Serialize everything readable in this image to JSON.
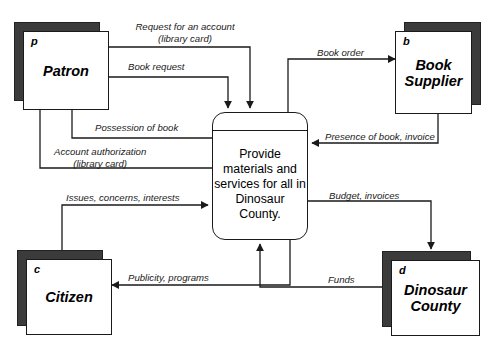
{
  "diagram": {
    "type": "data-flow-diagram"
  },
  "process": {
    "id": "",
    "label": "Provide materials and services for all in Dinosaur County."
  },
  "entities": [
    {
      "key": "patron",
      "id": "p",
      "name": "Patron"
    },
    {
      "key": "book_supplier",
      "id": "b",
      "name": "Book Supplier"
    },
    {
      "key": "citizen",
      "id": "c",
      "name": "Citizen"
    },
    {
      "key": "dinosaur_county",
      "id": "d",
      "name": "Dinosaur County"
    }
  ],
  "flows": [
    {
      "key": "request_account",
      "line1": "Request for an account",
      "line2": "(library card)",
      "from": "patron",
      "to": "process"
    },
    {
      "key": "book_request",
      "line1": "Book request",
      "line2": "",
      "from": "patron",
      "to": "process"
    },
    {
      "key": "possession_book",
      "line1": "Possession of book",
      "line2": "",
      "from": "process",
      "to": "patron"
    },
    {
      "key": "account_auth",
      "line1": "Account authorization",
      "line2": "(library card)",
      "from": "process",
      "to": "patron"
    },
    {
      "key": "book_order",
      "line1": "Book order",
      "line2": "",
      "from": "process",
      "to": "book_supplier"
    },
    {
      "key": "presence_invoice",
      "line1": "Presence of book, invoice",
      "line2": "",
      "from": "book_supplier",
      "to": "process"
    },
    {
      "key": "issues_concerns",
      "line1": "Issues, concerns, interests",
      "line2": "",
      "from": "citizen",
      "to": "process"
    },
    {
      "key": "publicity",
      "line1": "Publicity, programs",
      "line2": "",
      "from": "process",
      "to": "citizen"
    },
    {
      "key": "budget_invoices",
      "line1": "Budget, invoices",
      "line2": "",
      "from": "process",
      "to": "dinosaur_county"
    },
    {
      "key": "funds",
      "line1": "Funds",
      "line2": "",
      "from": "dinosaur_county",
      "to": "process"
    }
  ],
  "colors": {
    "stroke": "#1a1a1a",
    "shadow": "#3b3b3b",
    "background": "#ffffff"
  }
}
